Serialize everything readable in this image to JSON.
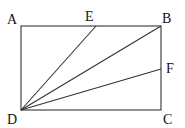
{
  "diagram": {
    "type": "geometry",
    "shape": "rectangle ABCD with segments DE, DB, DF",
    "points": {
      "A": {
        "label": "A",
        "x": 21,
        "y": 26
      },
      "B": {
        "label": "B",
        "x": 161,
        "y": 26
      },
      "C": {
        "label": "C",
        "x": 161,
        "y": 110
      },
      "D": {
        "label": "D",
        "x": 21,
        "y": 110
      },
      "E": {
        "label": "E",
        "x": 96,
        "y": 26
      },
      "F": {
        "label": "F",
        "x": 161,
        "y": 69
      }
    },
    "segments": [
      "AB",
      "BC",
      "CD",
      "DA",
      "DE",
      "DB",
      "DF"
    ],
    "colors": {
      "line": "#333333",
      "text": "#111111",
      "background": "#ffffff"
    }
  }
}
